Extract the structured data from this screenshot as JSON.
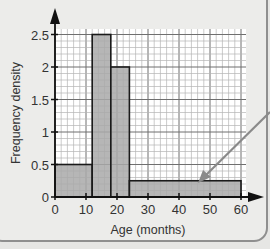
{
  "chart_data": {
    "type": "bar",
    "subtype": "histogram",
    "title": "",
    "xlabel": "Age (months)",
    "ylabel": "Frequency density",
    "xlim": [
      0,
      60
    ],
    "ylim": [
      0,
      2.5
    ],
    "x_ticks": [
      "0",
      "10",
      "20",
      "30",
      "40",
      "50",
      "60"
    ],
    "y_ticks": [
      "0",
      "0.5",
      "1",
      "1.5",
      "2",
      "2.5"
    ],
    "grid": true,
    "bins": [
      {
        "from": 0,
        "to": 12,
        "value": 0.5
      },
      {
        "from": 12,
        "to": 18,
        "value": 2.5
      },
      {
        "from": 18,
        "to": 24,
        "value": 2
      },
      {
        "from": 24,
        "to": 60,
        "value": 0.25
      }
    ],
    "annotations": [
      "arrow pointing to the 24–60 bar"
    ],
    "colors": {
      "bar": "#a9a9a9",
      "grid_minor": "#b5b5b5",
      "grid_major": "#6f6f6f",
      "axis": "#111111",
      "arrow": "#8a8a8a"
    }
  }
}
